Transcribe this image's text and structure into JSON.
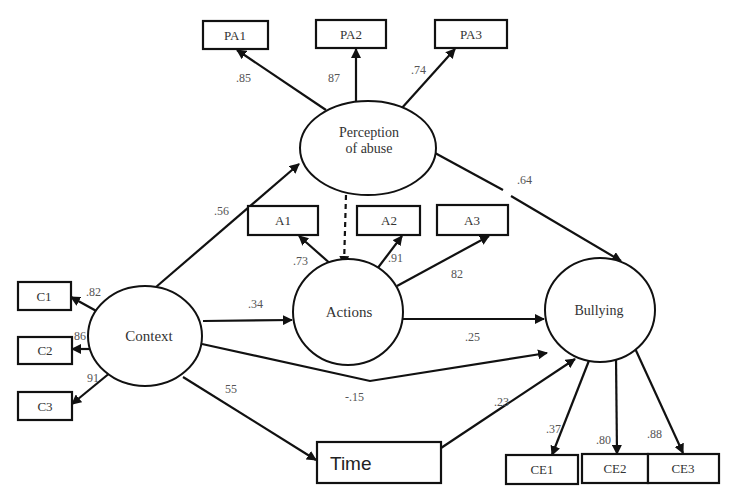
{
  "diagram": {
    "type": "structural-equation-model",
    "latent_variables": {
      "perception": {
        "line1": "Perception",
        "line2": "of abuse"
      },
      "actions": {
        "label": "Actions"
      },
      "context": {
        "label": "Context"
      },
      "bullying": {
        "label": "Bullying"
      }
    },
    "observed_variables": {
      "pa1": "PA1",
      "pa2": "PA2",
      "pa3": "PA3",
      "a1": "A1",
      "a2": "A2",
      "a3": "A3",
      "c1": "C1",
      "c2": "C2",
      "c3": "C3",
      "ce1": "CE1",
      "ce2": "CE2",
      "ce3": "CE3",
      "time": "Time"
    },
    "coefficients": {
      "perception_pa1": ".85",
      "perception_pa2": "87",
      "perception_pa3": ".74",
      "perception_bullying": ".64",
      "context_perception": ".56",
      "actions_a1": ".73",
      "actions_a2": ".91",
      "actions_a3": "82",
      "context_c1": ".82",
      "context_c2": "86",
      "context_c3": "91",
      "context_actions": ".34",
      "actions_bullying": ".25",
      "context_bullying": "-.15",
      "context_time": "55",
      "time_bullying": ".23",
      "bullying_ce1": ".37",
      "bullying_ce2": ".80",
      "bullying_ce3": ".88"
    },
    "edges": [
      {
        "from": "Perception of abuse",
        "to": "PA1",
        "value": ".85"
      },
      {
        "from": "Perception of abuse",
        "to": "PA2",
        "value": "87"
      },
      {
        "from": "Perception of abuse",
        "to": "PA3",
        "value": ".74"
      },
      {
        "from": "Perception of abuse",
        "to": "Bullying",
        "value": ".64"
      },
      {
        "from": "Perception of abuse",
        "to": "Actions",
        "value": "",
        "style": "dashed"
      },
      {
        "from": "Context",
        "to": "Perception of abuse",
        "value": ".56"
      },
      {
        "from": "Actions",
        "to": "A1",
        "value": ".73"
      },
      {
        "from": "Actions",
        "to": "A2",
        "value": ".91"
      },
      {
        "from": "Actions",
        "to": "A3",
        "value": "82"
      },
      {
        "from": "Context",
        "to": "C1",
        "value": ".82"
      },
      {
        "from": "Context",
        "to": "C2",
        "value": "86"
      },
      {
        "from": "Context",
        "to": "C3",
        "value": "91"
      },
      {
        "from": "Context",
        "to": "Actions",
        "value": ".34"
      },
      {
        "from": "Actions",
        "to": "Bullying",
        "value": ".25"
      },
      {
        "from": "Context",
        "to": "Bullying",
        "value": "-.15"
      },
      {
        "from": "Context",
        "to": "Time",
        "value": "55"
      },
      {
        "from": "Time",
        "to": "Bullying",
        "value": ".23"
      },
      {
        "from": "Bullying",
        "to": "CE1",
        "value": ".37"
      },
      {
        "from": "Bullying",
        "to": "CE2",
        "value": ".80"
      },
      {
        "from": "Bullying",
        "to": "CE3",
        "value": ".88"
      }
    ]
  }
}
